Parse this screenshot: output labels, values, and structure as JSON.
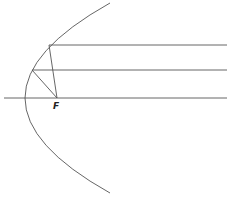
{
  "diagram": {
    "title": "",
    "colors": {
      "stroke": "#555555",
      "background": "#ffffff",
      "label": "#222222"
    },
    "focus": {
      "label": "F",
      "x": 57,
      "y": 98
    },
    "parabola": {
      "vertex": [
        25,
        98
      ],
      "top_end": [
        110,
        3
      ],
      "bottom_end": [
        110,
        193
      ]
    },
    "axis": {
      "y": 98,
      "x_start": 4,
      "x_end": 227
    },
    "rays": [
      {
        "name": "upper-ray",
        "y": 45,
        "hit_x": 49
      },
      {
        "name": "middle-ray",
        "y": 70,
        "hit_x": 32
      }
    ]
  }
}
